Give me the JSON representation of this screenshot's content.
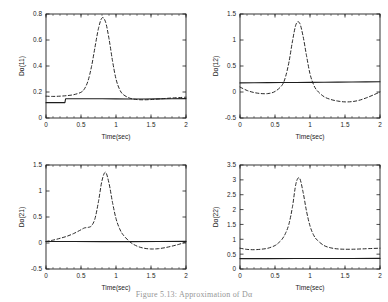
{
  "figure": {
    "caption": "Figure 5.13: Approximation of Dα",
    "xlabel": "Time(sec)",
    "xticks": [
      "0",
      "0.5",
      "1",
      "1.5",
      "2"
    ],
    "line_colors": {
      "solid": "#1d1d1d",
      "dashed": "#1d1d1d",
      "axis": "#1d1d1d"
    }
  },
  "chart_data": [
    {
      "id": "panel-11",
      "type": "line",
      "title": "",
      "xlabel": "Time(sec)",
      "ylabel": "Dα(11)",
      "xlim": [
        0,
        2
      ],
      "ylim": [
        0,
        0.8
      ],
      "xticks": [
        0,
        0.5,
        1,
        1.5,
        2
      ],
      "yticks": [
        0,
        0.2,
        0.4,
        0.6,
        0.8
      ],
      "xticklabels": [
        "0",
        "0.5",
        "1",
        "1.5",
        "2"
      ],
      "yticklabels": [
        "0",
        "0.2",
        "0.4",
        "0.6",
        "0.8"
      ],
      "grid": false,
      "legend": null,
      "series": [
        {
          "name": "solid",
          "style": "solid",
          "x": [
            0,
            0.1,
            0.2,
            0.27,
            0.28,
            0.4,
            0.6,
            0.8,
            1.0,
            1.2,
            1.4,
            1.6,
            1.8,
            2.0
          ],
          "values": [
            0.118,
            0.118,
            0.118,
            0.118,
            0.148,
            0.148,
            0.148,
            0.148,
            0.147,
            0.146,
            0.146,
            0.147,
            0.148,
            0.149
          ]
        },
        {
          "name": "dashed",
          "style": "dashed",
          "x": [
            0,
            0.1,
            0.2,
            0.3,
            0.4,
            0.5,
            0.55,
            0.6,
            0.65,
            0.7,
            0.75,
            0.8,
            0.85,
            0.9,
            0.95,
            1.0,
            1.05,
            1.1,
            1.2,
            1.3,
            1.4,
            1.5,
            1.6,
            1.7,
            1.8,
            1.9,
            2.0
          ],
          "values": [
            0.168,
            0.166,
            0.168,
            0.172,
            0.18,
            0.198,
            0.225,
            0.285,
            0.395,
            0.545,
            0.69,
            0.77,
            0.74,
            0.61,
            0.44,
            0.3,
            0.222,
            0.182,
            0.152,
            0.142,
            0.14,
            0.142,
            0.146,
            0.15,
            0.154,
            0.157,
            0.16
          ]
        }
      ]
    },
    {
      "id": "panel-12",
      "type": "line",
      "title": "",
      "xlabel": "Time(sec)",
      "ylabel": "Dα(12)",
      "xlim": [
        0,
        2
      ],
      "ylim": [
        -0.5,
        1.5
      ],
      "xticks": [
        0,
        0.5,
        1,
        1.5,
        2
      ],
      "yticks": [
        -0.5,
        0,
        0.5,
        1,
        1.5
      ],
      "xticklabels": [
        "0",
        "0.5",
        "1",
        "1.5",
        "2"
      ],
      "yticklabels": [
        "-0.5",
        "0",
        "0.5",
        "1",
        "1.5"
      ],
      "grid": false,
      "legend": null,
      "series": [
        {
          "name": "solid",
          "style": "solid",
          "x": [
            0,
            0.2,
            0.4,
            0.6,
            0.8,
            1.0,
            1.2,
            1.4,
            1.6,
            1.8,
            2.0
          ],
          "values": [
            0.175,
            0.178,
            0.18,
            0.182,
            0.184,
            0.186,
            0.188,
            0.19,
            0.192,
            0.194,
            0.196
          ]
        },
        {
          "name": "dashed",
          "style": "dashed",
          "x": [
            0,
            0.1,
            0.2,
            0.3,
            0.4,
            0.5,
            0.6,
            0.65,
            0.7,
            0.75,
            0.8,
            0.85,
            0.9,
            0.95,
            1.0,
            1.05,
            1.1,
            1.2,
            1.3,
            1.4,
            1.5,
            1.6,
            1.7,
            1.8,
            1.9,
            2.0
          ],
          "values": [
            0.095,
            0.03,
            -0.01,
            -0.03,
            -0.03,
            0.01,
            0.13,
            0.29,
            0.58,
            0.98,
            1.3,
            1.33,
            1.08,
            0.7,
            0.35,
            0.145,
            0.03,
            -0.09,
            -0.145,
            -0.175,
            -0.19,
            -0.185,
            -0.16,
            -0.115,
            -0.06,
            0.0
          ]
        }
      ]
    },
    {
      "id": "panel-21",
      "type": "line",
      "title": "",
      "xlabel": "Time(sec)",
      "ylabel": "Dα(21)",
      "xlim": [
        0,
        2
      ],
      "ylim": [
        -0.5,
        1.5
      ],
      "xticks": [
        0,
        0.5,
        1,
        1.5,
        2
      ],
      "yticks": [
        -0.5,
        0,
        0.5,
        1,
        1.5
      ],
      "xticklabels": [
        "0",
        "0.5",
        "1",
        "1.5",
        "2"
      ],
      "yticklabels": [
        "-0.5",
        "0",
        "0.5",
        "1",
        "1.5"
      ],
      "grid": false,
      "legend": null,
      "series": [
        {
          "name": "solid",
          "style": "solid",
          "x": [
            0,
            0.4,
            0.8,
            1.2,
            1.6,
            2.0
          ],
          "values": [
            0.03,
            0.028,
            0.026,
            0.026,
            0.028,
            0.032
          ]
        },
        {
          "name": "dashed",
          "style": "dashed",
          "x": [
            0,
            0.1,
            0.2,
            0.3,
            0.4,
            0.5,
            0.55,
            0.6,
            0.65,
            0.7,
            0.75,
            0.8,
            0.85,
            0.9,
            0.95,
            1.0,
            1.05,
            1.1,
            1.2,
            1.3,
            1.4,
            1.5,
            1.6,
            1.7,
            1.8,
            1.9,
            2.0
          ],
          "values": [
            0.03,
            0.055,
            0.09,
            0.13,
            0.185,
            0.255,
            0.29,
            0.3,
            0.33,
            0.47,
            0.8,
            1.2,
            1.36,
            1.15,
            0.78,
            0.47,
            0.28,
            0.16,
            0.02,
            -0.06,
            -0.1,
            -0.115,
            -0.11,
            -0.09,
            -0.06,
            -0.025,
            0.02
          ]
        }
      ]
    },
    {
      "id": "panel-22",
      "type": "line",
      "title": "",
      "xlabel": "Time(sec)",
      "ylabel": "Dα(22)",
      "xlim": [
        0,
        2
      ],
      "ylim": [
        0,
        3.5
      ],
      "xticks": [
        0,
        0.5,
        1,
        1.5,
        2
      ],
      "yticks": [
        0,
        0.5,
        1,
        1.5,
        2,
        2.5,
        3,
        3.5
      ],
      "xticklabels": [
        "0",
        "0.5",
        "1",
        "1.5",
        "2"
      ],
      "yticklabels": [
        "0",
        "0.5",
        "1",
        "1.5",
        "2",
        "2.5",
        "3",
        "3.5"
      ],
      "grid": false,
      "legend": null,
      "series": [
        {
          "name": "solid",
          "style": "solid",
          "x": [
            0,
            0.4,
            0.8,
            1.2,
            1.6,
            2.0
          ],
          "values": [
            0.35,
            0.35,
            0.352,
            0.352,
            0.354,
            0.356
          ]
        },
        {
          "name": "dashed",
          "style": "dashed",
          "x": [
            0,
            0.1,
            0.2,
            0.3,
            0.4,
            0.5,
            0.55,
            0.6,
            0.65,
            0.7,
            0.75,
            0.8,
            0.85,
            0.9,
            0.95,
            1.0,
            1.05,
            1.1,
            1.2,
            1.3,
            1.4,
            1.5,
            1.6,
            1.7,
            1.8,
            1.9,
            2.0
          ],
          "values": [
            0.7,
            0.66,
            0.65,
            0.665,
            0.7,
            0.79,
            0.88,
            1.0,
            1.2,
            1.52,
            2.1,
            2.88,
            3.06,
            2.6,
            1.95,
            1.45,
            1.15,
            0.98,
            0.79,
            0.71,
            0.675,
            0.665,
            0.665,
            0.672,
            0.682,
            0.692,
            0.7
          ]
        }
      ]
    }
  ]
}
